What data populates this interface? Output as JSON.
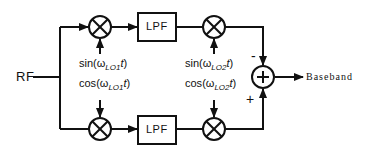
{
  "diagram": {
    "type": "image-reject receiver block diagram",
    "input_label": "RF",
    "output_label": "Baseband",
    "top_path": {
      "filter_label": "LPF",
      "lo1_label": {
        "fn": "sin",
        "omega": "ω",
        "sub": "LO1",
        "var": "t"
      },
      "lo2_label": {
        "fn": "sin",
        "omega": "ω",
        "sub": "LO2",
        "var": "t"
      },
      "summer_sign": "-"
    },
    "bottom_path": {
      "filter_label": "LPF",
      "lo1_label": {
        "fn": "cos",
        "omega": "ω",
        "sub": "LO1",
        "var": "t"
      },
      "lo2_label": {
        "fn": "cos",
        "omega": "ω",
        "sub": "LO2",
        "var": "t"
      },
      "summer_sign": "+"
    },
    "summer_symbol": "+",
    "mixer_symbol": "×",
    "colors": {
      "stroke": "#111111",
      "background": "#ffffff"
    }
  }
}
